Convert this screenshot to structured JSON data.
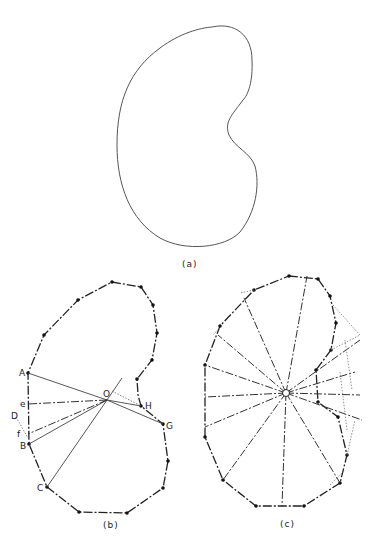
{
  "figure": {
    "panels": [
      {
        "id": "a",
        "caption": "(a)",
        "description": "smooth kidney-shaped closed curve"
      },
      {
        "id": "b",
        "caption": "(b)",
        "description": "polygonal approximation with radial lines from interior point O",
        "point_labels": {
          "A": "A",
          "B": "B",
          "C": "C",
          "D": "D",
          "e": "e",
          "f": "f",
          "G": "G",
          "H": "H",
          "O": "O",
          "I": "I"
        }
      },
      {
        "id": "c",
        "caption": "(c)",
        "description": "polygonal approximation with many dash-dot radial lines from center O",
        "point_labels": {
          "O": "O"
        }
      }
    ],
    "colors": {
      "stroke": "#222222",
      "thin": "#555555",
      "dotted": "#777777"
    }
  }
}
